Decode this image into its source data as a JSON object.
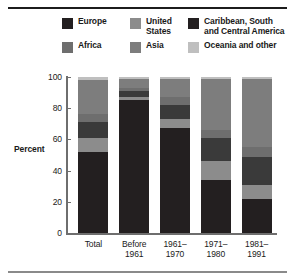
{
  "chart_data": {
    "type": "bar",
    "subtype": "stacked-bar-100",
    "title": "",
    "xlabel": "",
    "ylabel": "Percent",
    "ylim": [
      0,
      100
    ],
    "yticks": [
      0,
      20,
      40,
      60,
      80,
      100
    ],
    "ytick_labels": [
      "0",
      "20",
      "40",
      "60",
      "80",
      "100"
    ],
    "grid": false,
    "legend_position": "top",
    "categories": [
      "Total",
      "Before 1961",
      "1961-1970",
      "1971-1980",
      "1981-1991"
    ],
    "category_label_lines": [
      [
        "Total",
        ""
      ],
      [
        "Before",
        "1961"
      ],
      [
        "1961–",
        "1970"
      ],
      [
        "1971–",
        "1980"
      ],
      [
        "1981–",
        "1991"
      ]
    ],
    "series": [
      {
        "name": "Europe",
        "color": "#231f20",
        "values": [
          52,
          85,
          67,
          34,
          22
        ]
      },
      {
        "name": "United States",
        "color": "#8c8c8c",
        "values": [
          9,
          2,
          6,
          12,
          9
        ]
      },
      {
        "name": "Caribbean, South and Central America",
        "color": "#3a3a3a",
        "values": [
          10,
          4,
          9,
          15,
          18
        ]
      },
      {
        "name": "Africa",
        "color": "#6e6e6e",
        "values": [
          5,
          2,
          5,
          5,
          6
        ]
      },
      {
        "name": "Asia",
        "color": "#7d7d7d",
        "values": [
          22,
          6,
          12,
          33,
          44
        ]
      },
      {
        "name": "Oceania and other",
        "color": "#bfbfbf",
        "values": [
          2,
          1,
          1,
          1,
          1
        ]
      }
    ]
  },
  "legend": {
    "rows": [
      [
        {
          "label": "Europe",
          "color": "#231f20"
        },
        {
          "label": "United\nStates",
          "color": "#8c8c8c"
        },
        {
          "label": "Caribbean, South\nand Central America",
          "color": "#231f20"
        }
      ],
      [
        {
          "label": "Africa",
          "color": "#6e6e6e"
        },
        {
          "label": "Asia",
          "color": "#7d7d7d"
        },
        {
          "label": "Oceania and other",
          "color": "#bfbfbf"
        }
      ]
    ],
    "items": [
      "Europe",
      "United States",
      "Caribbean, South and Central America",
      "Africa",
      "Asia",
      "Oceania and other"
    ]
  },
  "axis": {
    "y_title": "Percent"
  },
  "colors": {
    "europe": "#231f20",
    "united_states": "#8c8c8c",
    "caribbean": "#3a3a3a",
    "africa": "#6e6e6e",
    "asia": "#7d7d7d",
    "oceania": "#bfbfbf",
    "axis": "#6e6e6e",
    "text": "#1a1a1a",
    "rule_top": "#1c1c1c",
    "rule_bottom": "#8a8a8a",
    "background": "#ffffff"
  }
}
